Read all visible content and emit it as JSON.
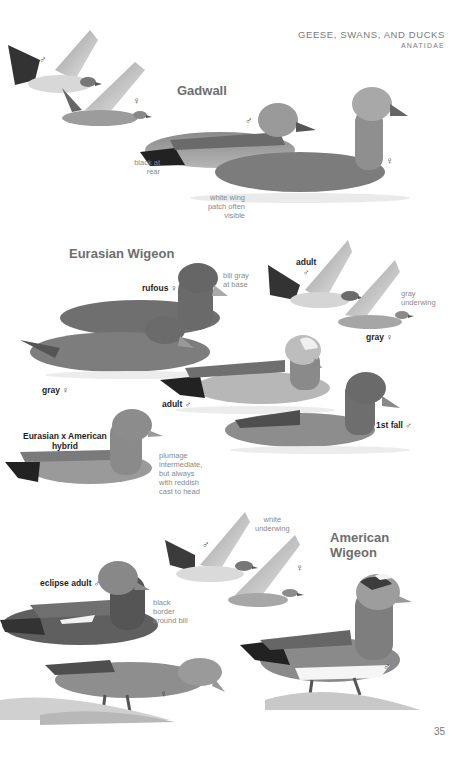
{
  "header": {
    "section": "GEESE, SWANS, AND DUCKS",
    "family": "ANATIDAE"
  },
  "species": [
    {
      "name": "Gadwall",
      "labels": [
        {
          "id": "flying_male",
          "text": "♂"
        },
        {
          "id": "flying_female",
          "text": "♀"
        },
        {
          "id": "swim_male",
          "text": "♂"
        },
        {
          "id": "swim_female",
          "text": "♀"
        }
      ],
      "notes": [
        {
          "id": "black_rear",
          "text": "black at\nrear"
        },
        {
          "id": "wing_patch",
          "text": "white wing\npatch often\nvisible"
        }
      ]
    },
    {
      "name": "Eurasian Wigeon",
      "labels": [
        {
          "id": "rufous_female",
          "text": "rufous ♀"
        },
        {
          "id": "gray_female",
          "text": "gray ♀"
        },
        {
          "id": "flying_adult_male",
          "text": "adult\n♂"
        },
        {
          "id": "flying_gray_female",
          "text": "gray ♀"
        },
        {
          "id": "adult_male",
          "text": "adult ♂"
        },
        {
          "id": "first_fall_male",
          "text": "1st fall ♂"
        },
        {
          "id": "hybrid",
          "text": "Eurasian x American\nhybrid"
        }
      ],
      "notes": [
        {
          "id": "bill_gray",
          "text": "bill gray\nat base"
        },
        {
          "id": "gray_underwing",
          "text": "gray\nunderwing"
        },
        {
          "id": "hybrid_plumage",
          "text": "plumage\nintermediate,\nbut always\nwith reddish\ncast to head"
        }
      ]
    },
    {
      "name": "American\nWigeon",
      "labels": [
        {
          "id": "flying_male",
          "text": "♂"
        },
        {
          "id": "flying_female",
          "text": "♀"
        },
        {
          "id": "eclipse_male",
          "text": "eclipse adult ♂"
        },
        {
          "id": "ground_female",
          "text": "♀"
        },
        {
          "id": "standing_male",
          "text": "♂"
        }
      ],
      "notes": [
        {
          "id": "white_underwing",
          "text": "white\nunderwing"
        },
        {
          "id": "black_border",
          "text": "black\nborder\naround bill"
        }
      ]
    }
  ],
  "page_number": "35",
  "colors": {
    "heading": "#6e6e6e",
    "label": "#1e1e1e",
    "note": "#8a8a8a"
  }
}
